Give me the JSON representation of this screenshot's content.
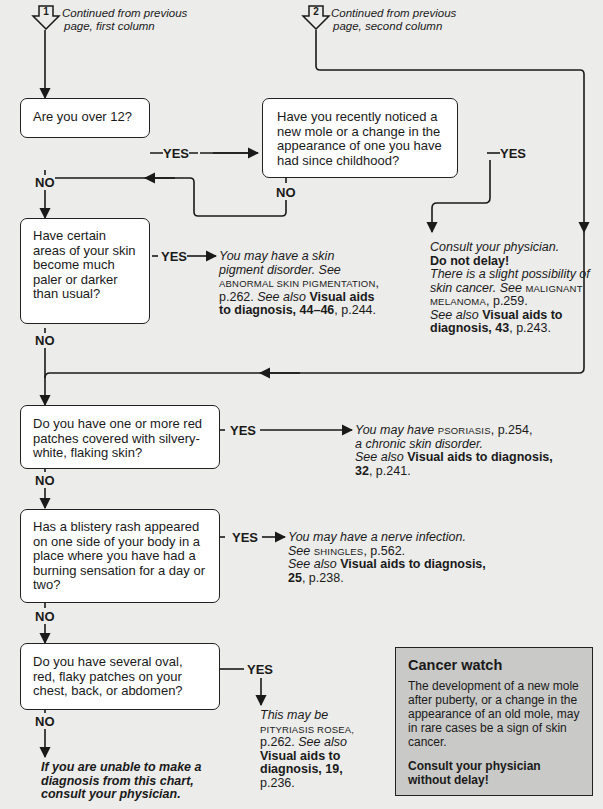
{
  "continuations": [
    {
      "number": "1",
      "line1": "Continued from previous",
      "line2": "page, first column"
    },
    {
      "number": "2",
      "line1": "Continued from previous",
      "line2": "page, second column"
    }
  ],
  "labels": {
    "yes": "YES",
    "no": "NO"
  },
  "questions": [
    {
      "id": "q1",
      "text": "Are you over 12?"
    },
    {
      "id": "q2",
      "text": "Have you recently noticed a new mole or a change in the appearance of one you have had since childhood?"
    },
    {
      "id": "q3",
      "text": "Have certain areas of your skin become much paler or darker than usual?"
    },
    {
      "id": "q4",
      "text": "Do you have one or more red patches covered with silvery-white, flaking skin?"
    },
    {
      "id": "q5",
      "text": "Has a blistery rash appeared on one side of your body in a place where you have had a burning sensation for a day or two?"
    },
    {
      "id": "q6",
      "text": "Do you have several oval, red, flaky patches on your chest, back, or abdomen?"
    }
  ],
  "outcomes": {
    "melanoma": {
      "p1": "Consult your physician.",
      "p2": "Do not delay",
      "p2_end": "!",
      "p3": "There is a slight possibility of skin cancer. See",
      "ref": "MALIGNANT MELANOMA",
      "ref_page": ", p.259.",
      "see_also": "See also",
      "visual": "Visual aids to diagnosis, 43",
      "visual_page": ", p.243."
    },
    "pigment": {
      "p1": "You may have a skin pigment disorder. See",
      "ref": "ABNORMAL SKIN PIGMENTATION",
      "ref_page": ", p.262.",
      "see_also": "See also",
      "visual": "Visual aids to diagnosis, 44–46",
      "visual_page": ", p.244."
    },
    "psoriasis": {
      "p1": "You may have",
      "ref": "PSORIASIS",
      "ref_page": ", p.254,",
      "p2": "a chronic skin disorder.",
      "see_also": "See also",
      "visual": "Visual aids to diagnosis, 32",
      "visual_page": ", p.241."
    },
    "shingles": {
      "p1": "You may have a nerve infection.",
      "see": "See",
      "ref": "SHINGLES",
      "ref_page": ", p.562.",
      "see_also": "See also",
      "visual": "Visual aids to diagnosis, 25",
      "visual_page": ", p.238."
    },
    "pityriasis": {
      "p1": "This may be",
      "ref": "PITYRIASIS ROSEA,",
      "ref_page": "p.262.",
      "see_also": "See also",
      "visual": "Visual aids to diagnosis, 19,",
      "visual_page": "p.236."
    },
    "fallback": {
      "text": "If you are unable to make a diagnosis from this chart, consult your physician."
    }
  },
  "cancer_watch": {
    "title": "Cancer watch",
    "body": "The development of a new mole after puberty, or a change in the appearance of an old mole, may in rare cases be a sign of skin cancer.",
    "cta": "Consult your physician without delay",
    "cta_end": "!"
  },
  "colors": {
    "background": "#ececea",
    "box": "#ffffff",
    "line": "#1a1a1a",
    "callout": "#c9c9c7"
  }
}
